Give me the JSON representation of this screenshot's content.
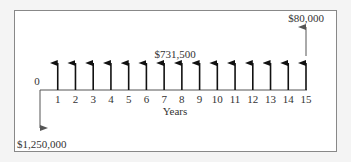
{
  "diagram": {
    "type": "cash-flow-timeline",
    "origin_label": "0",
    "axis_label": "Years",
    "periods": [
      "1",
      "2",
      "3",
      "4",
      "5",
      "6",
      "7",
      "8",
      "9",
      "10",
      "11",
      "12",
      "13",
      "14",
      "15"
    ],
    "initial_outflow_label": "$1,250,000",
    "annual_inflow_label": "$731,500",
    "salvage_label": "$80,000",
    "initial_outflow": 1250000,
    "annual_inflow": 731500,
    "salvage_value": 80000,
    "arrow_color": "#111111",
    "thin_arrow_color": "#555555"
  }
}
